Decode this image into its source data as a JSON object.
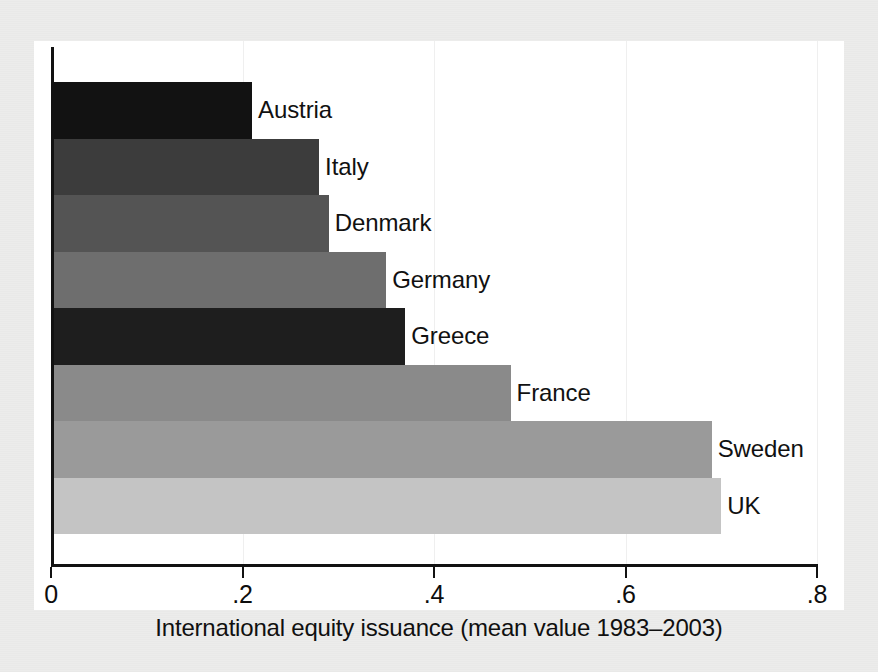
{
  "chart_data": {
    "type": "bar",
    "orientation": "horizontal",
    "title": "",
    "xlabel": "International equity issuance (mean value 1983–2003)",
    "ylabel": "",
    "categories": [
      "Austria",
      "Italy",
      "Denmark",
      "Germany",
      "Greece",
      "France",
      "Sweden",
      "UK"
    ],
    "values": [
      0.21,
      0.28,
      0.29,
      0.35,
      0.37,
      0.48,
      0.69,
      0.7
    ],
    "xlim": [
      0,
      0.8
    ],
    "xticks": [
      0,
      0.2,
      0.4,
      0.6,
      0.8
    ],
    "xtick_labels": [
      "0",
      ".2",
      ".4",
      ".6",
      ".8"
    ],
    "grid": true,
    "grid_axis": "x",
    "legend": false,
    "bar_colors": [
      "#121212",
      "#3c3c3c",
      "#545454",
      "#6e6e6e",
      "#1e1e1e",
      "#8a8a8a",
      "#9a9a9a",
      "#c4c4c4"
    ],
    "labels_inline": true
  },
  "axis": {
    "x_title": "International equity issuance (mean value 1983–2003)",
    "ticks": [
      {
        "value": 0,
        "label": "0"
      },
      {
        "value": 0.2,
        "label": ".2"
      },
      {
        "value": 0.4,
        "label": ".4"
      },
      {
        "value": 0.6,
        "label": ".6"
      },
      {
        "value": 0.8,
        "label": ".8"
      }
    ]
  },
  "bars": [
    {
      "label": "Austria",
      "value": 0.21,
      "color": "#121212"
    },
    {
      "label": "Italy",
      "value": 0.28,
      "color": "#3c3c3c"
    },
    {
      "label": "Denmark",
      "value": 0.29,
      "color": "#545454"
    },
    {
      "label": "Germany",
      "value": 0.35,
      "color": "#6e6e6e"
    },
    {
      "label": "Greece",
      "value": 0.37,
      "color": "#1e1e1e"
    },
    {
      "label": "France",
      "value": 0.48,
      "color": "#8a8a8a"
    },
    {
      "label": "Sweden",
      "value": 0.69,
      "color": "#9a9a9a"
    },
    {
      "label": "UK",
      "value": 0.7,
      "color": "#c4c4c4"
    }
  ],
  "style": {
    "page_background": "#ececeb",
    "plot_background": "#ffffff",
    "axis_color": "#121212",
    "gridline_color": "#efefef",
    "text_color": "#101010"
  }
}
